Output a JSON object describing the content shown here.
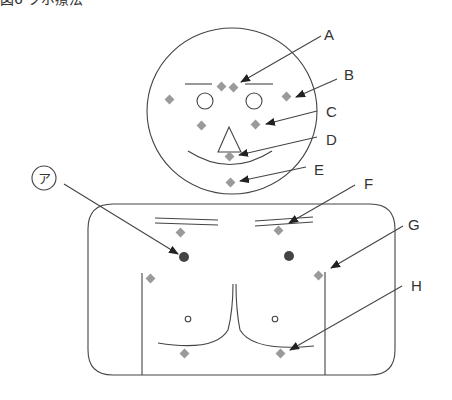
{
  "title": "図6 ツボ療法",
  "colors": {
    "line": "#444444",
    "acupoint": "#9a9a9a",
    "marked_point": "#444444",
    "background": "#ffffff"
  },
  "labels": {
    "A": "A",
    "B": "B",
    "C": "C",
    "D": "D",
    "E": "E",
    "F": "F",
    "G": "G",
    "H": "H",
    "circled": "ア"
  },
  "figure": {
    "face_points": [
      "A",
      "B",
      "C",
      "D",
      "E"
    ],
    "torso_points": [
      "F",
      "G",
      "H"
    ],
    "marked_point": "ア"
  }
}
